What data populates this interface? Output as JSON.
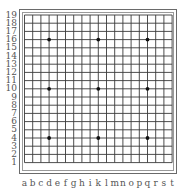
{
  "board": {
    "size": 19,
    "line_color": "#3a3a3a",
    "star_color": "#111111",
    "column_labels": [
      "a",
      "b",
      "c",
      "d",
      "e",
      "f",
      "g",
      "h",
      "i",
      "k",
      "l",
      "m",
      "n",
      "o",
      "p",
      "q",
      "r",
      "s",
      "t"
    ],
    "row_labels": [
      "19",
      "18",
      "17",
      "16",
      "15",
      "14",
      "13",
      "12",
      "11",
      "10",
      "9",
      "8",
      "7",
      "6",
      "5",
      "4",
      "3",
      "2",
      "1"
    ],
    "star_points": [
      {
        "col": "d",
        "row": 16
      },
      {
        "col": "k",
        "row": 16
      },
      {
        "col": "q",
        "row": 16
      },
      {
        "col": "d",
        "row": 10
      },
      {
        "col": "k",
        "row": 10
      },
      {
        "col": "q",
        "row": 10
      },
      {
        "col": "d",
        "row": 4
      },
      {
        "col": "k",
        "row": 4
      },
      {
        "col": "q",
        "row": 4
      }
    ],
    "stones": []
  }
}
